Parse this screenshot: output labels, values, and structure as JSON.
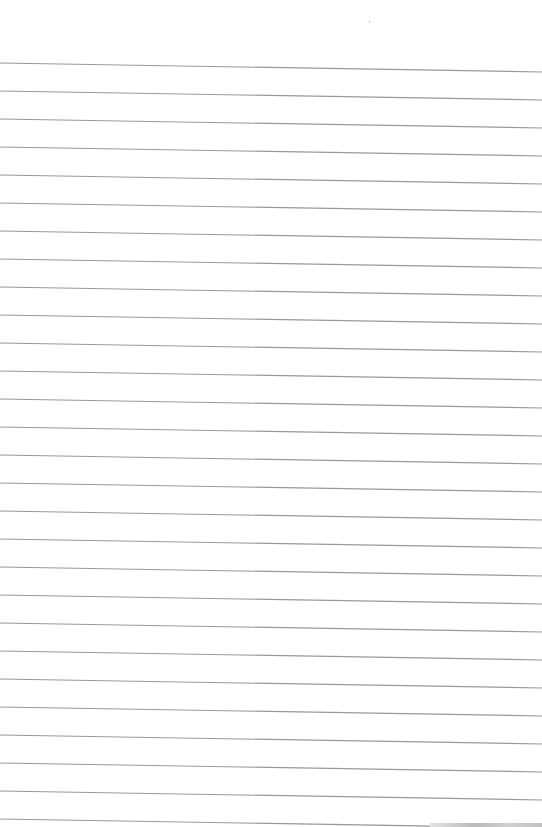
{
  "document": {
    "type": "lined-paper",
    "content": "",
    "ruled_lines": {
      "count": 28,
      "first_y_left": 63,
      "first_y_right": 72,
      "spacing": 28,
      "color": "#9a9a9a"
    },
    "background": "#ffffff"
  }
}
